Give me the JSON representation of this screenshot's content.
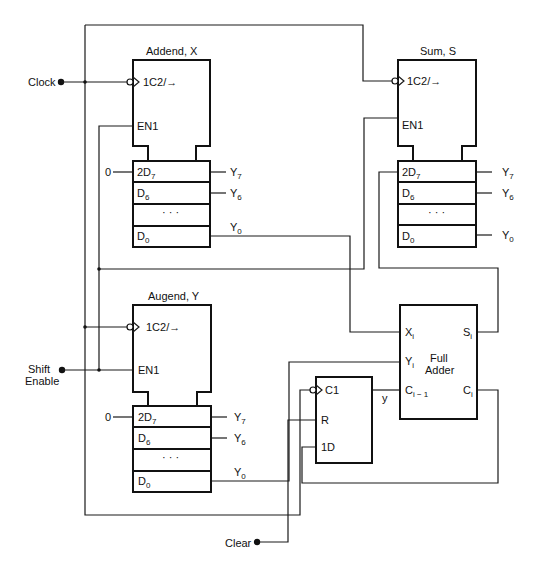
{
  "inputs": {
    "clock": "Clock",
    "shift_enable_line1": "Shift",
    "shift_enable_line2": "Enable",
    "clear": "Clear"
  },
  "registers": {
    "addend": {
      "title": "Addend, X",
      "control_clock": "1C2/→",
      "control_enable": "EN1",
      "serial_input_value": "0",
      "cells": [
        "2D",
        "D",
        "· · ·",
        "D"
      ],
      "cell_subscripts": [
        "7",
        "6",
        "",
        "0"
      ],
      "outputs": [
        "Y",
        "Y",
        "Y"
      ],
      "output_subscripts": [
        "7",
        "6",
        "0"
      ]
    },
    "sum": {
      "title": "Sum, S",
      "control_clock": "1C2/→",
      "control_enable": "EN1",
      "cells": [
        "2D",
        "D",
        "· · ·",
        "D"
      ],
      "cell_subscripts": [
        "7",
        "6",
        "",
        "0"
      ],
      "outputs": [
        "Y",
        "Y",
        "Y"
      ],
      "output_subscripts": [
        "7",
        "6",
        "0"
      ]
    },
    "augend": {
      "title": "Augend, Y",
      "control_clock": "1C2/→",
      "control_enable": "EN1",
      "serial_input_value": "0",
      "cells": [
        "2D",
        "D",
        "· · ·",
        "D"
      ],
      "cell_subscripts": [
        "7",
        "6",
        "",
        "0"
      ],
      "outputs": [
        "Y",
        "Y",
        "Y"
      ],
      "output_subscripts": [
        "7",
        "6",
        "0"
      ]
    }
  },
  "full_adder": {
    "title_line1": "Full",
    "title_line2": "Adder",
    "inputs": [
      {
        "label": "X",
        "sub": "i"
      },
      {
        "label": "Y",
        "sub": "i"
      },
      {
        "label": "C",
        "sub": "i − 1"
      }
    ],
    "outputs": [
      {
        "label": "S",
        "sub": "i"
      },
      {
        "label": "C",
        "sub": "i"
      }
    ]
  },
  "carry_flipflop": {
    "clock": "C1",
    "reset": "R",
    "data": "1D",
    "output": "y"
  }
}
